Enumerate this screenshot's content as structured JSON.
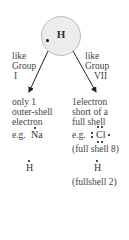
{
  "atom": {
    "symbol": "H",
    "fill_color": "#ececec",
    "electron_color": "#111111"
  },
  "left_branch": {
    "label_line1": "like",
    "label_line2": "Group",
    "label_line3": "I",
    "desc_line1": "only 1",
    "desc_line2": "outer-shell",
    "desc_line3": "electron",
    "example_prefix": "e.g.",
    "example_symbol": "Na",
    "hydrogen_symbol": "H"
  },
  "right_branch": {
    "label_line1": "like",
    "label_line2": "Group",
    "label_line3": "VII",
    "desc_line1": "1electron",
    "desc_line2": "short of a",
    "desc_line3": "full shell",
    "example_prefix": "e.g.",
    "example_symbol": "Cl",
    "example_note": "(full shell 8)",
    "hydrogen_symbol": "H",
    "hydrogen_note": "(fullshell 2)"
  }
}
